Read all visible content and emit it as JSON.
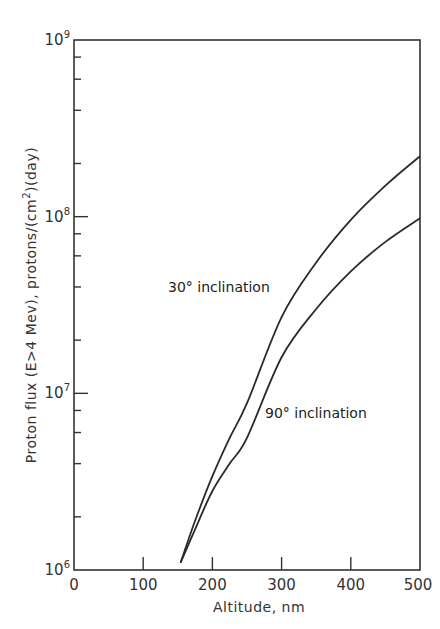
{
  "chart_data": {
    "type": "line",
    "title": "",
    "xlabel": "Altitude, nm",
    "ylabel": "Proton flux (E>4 Mev), protons/(cm²)(day)",
    "ylabel_parts": {
      "main": "Proton flux (E>4 Mev), protons/(cm",
      "sup": "2",
      "tail": ")(day)"
    },
    "xlim": [
      0,
      500
    ],
    "ylim": [
      1000000,
      1000000000
    ],
    "yscale": "log",
    "x_ticks": [
      0,
      100,
      200,
      300,
      400,
      500
    ],
    "x_tick_labels": [
      "0",
      "100",
      "200",
      "300",
      "400",
      "500"
    ],
    "y_ticks": [
      1000000,
      10000000,
      100000000,
      1000000000
    ],
    "y_tick_labels": [
      {
        "base": "10",
        "exp": "6"
      },
      {
        "base": "10",
        "exp": "7"
      },
      {
        "base": "10",
        "exp": "8"
      },
      {
        "base": "10",
        "exp": "9"
      }
    ],
    "y_minor_ticks_per_decade": [
      2,
      4,
      6,
      8
    ],
    "grid": false,
    "legend": "none (inline curve labels)",
    "series": [
      {
        "name": "30° inclination",
        "x": [
          154,
          175,
          200,
          225,
          250,
          300,
          350,
          400,
          450,
          500
        ],
        "values": [
          1100000,
          1900000,
          3400000,
          5600000,
          8800000,
          27000000,
          55000000,
          96000000,
          150000000,
          220000000
        ]
      },
      {
        "name": "90° inclination",
        "x": [
          154,
          175,
          200,
          225,
          250,
          300,
          350,
          400,
          450,
          500
        ],
        "values": [
          1100000,
          1700000,
          2800000,
          4000000,
          5600000,
          16000000,
          30000000,
          49000000,
          72000000,
          98000000
        ]
      }
    ],
    "annotations": [
      {
        "text": "30° inclination",
        "near_series": "30° inclination",
        "position": "left of curve around 300 nm"
      },
      {
        "text": "90° inclination",
        "near_series": "90° inclination",
        "position": "right of curve around 300 nm"
      }
    ]
  },
  "labels": {
    "x_axis_title": "Altitude, nm",
    "curve_30": "30° inclination",
    "curve_90": "90° inclination"
  }
}
